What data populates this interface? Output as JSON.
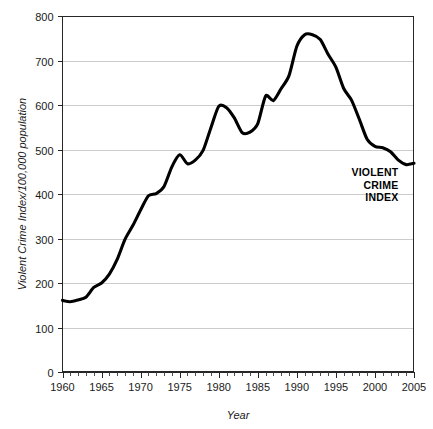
{
  "chart_data": {
    "type": "line",
    "title": "",
    "xlabel": "Year",
    "ylabel": "Violent Crime Index/100,000 population",
    "xlim": [
      1960,
      2005
    ],
    "ylim": [
      0,
      800
    ],
    "grid": true,
    "legend_position": "none",
    "ytick_labels": [
      "0",
      "100",
      "200",
      "300",
      "400",
      "500",
      "600",
      "700",
      "800"
    ],
    "ytick_values": [
      0,
      100,
      200,
      300,
      400,
      500,
      600,
      700,
      800
    ],
    "xtick_labels": [
      "1960",
      "1965",
      "1970",
      "1975",
      "1980",
      "1985",
      "1990",
      "1995",
      "2000",
      "2005"
    ],
    "xtick_values": [
      1960,
      1965,
      1970,
      1975,
      1980,
      1985,
      1990,
      1995,
      2000,
      2005
    ],
    "xtick_minor_step": 1,
    "series": [
      {
        "name": "VIOLENT CRIME INDEX",
        "color": "#000000",
        "x": [
          1960,
          1961,
          1962,
          1963,
          1964,
          1965,
          1966,
          1967,
          1968,
          1969,
          1970,
          1971,
          1972,
          1973,
          1974,
          1975,
          1976,
          1977,
          1978,
          1979,
          1980,
          1981,
          1982,
          1983,
          1984,
          1985,
          1986,
          1987,
          1988,
          1989,
          1990,
          1991,
          1992,
          1993,
          1994,
          1995,
          1996,
          1997,
          1998,
          1999,
          2000,
          2001,
          2002,
          2003,
          2004,
          2005
        ],
        "values": [
          161,
          158,
          162,
          168,
          190,
          200,
          220,
          253,
          298,
          329,
          364,
          396,
          401,
          417,
          461,
          488,
          468,
          476,
          498,
          549,
          597,
          594,
          571,
          538,
          539,
          558,
          620,
          610,
          637,
          666,
          732,
          758,
          758,
          747,
          714,
          685,
          637,
          611,
          568,
          523,
          507,
          504,
          495,
          476,
          466,
          469
        ]
      }
    ],
    "annotations": [
      {
        "name": "series-label",
        "lines": [
          "VIOLENT",
          "CRIME",
          "INDEX"
        ],
        "x": 2003,
        "y": 440,
        "align": "right",
        "bold": true
      }
    ],
    "colors": {
      "line": "#000000",
      "grid": "#bfbfbf",
      "axis": "#262626",
      "background": "#ffffff",
      "text": "#1a1a1a"
    }
  }
}
